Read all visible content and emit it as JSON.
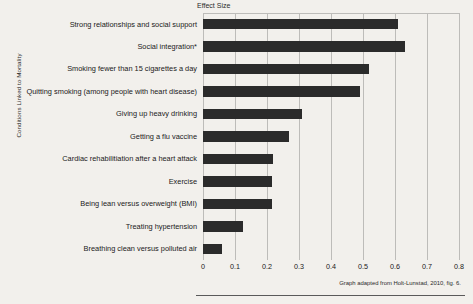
{
  "chart_data": {
    "type": "bar",
    "orientation": "horizontal",
    "title": "Effect Size",
    "xlabel": "Effect Size",
    "ylabel": "Conditions Linked to Mortality",
    "xlim": [
      0,
      0.8
    ],
    "xticks": [
      "0",
      "0.1",
      "0.2",
      "0.3",
      "0.4",
      "0.5",
      "0.6",
      "0.7",
      "0.8"
    ],
    "xtick_values": [
      0,
      0.1,
      0.2,
      0.3,
      0.4,
      0.5,
      0.6,
      0.7,
      0.8
    ],
    "grid": true,
    "legend": "none",
    "bar_color": "#2b2b2b",
    "background_color": "#f2f0ec",
    "gridline_color": "#bdbcb9",
    "categories": [
      "Strong relationships and social support",
      "Social integration*",
      "Smoking fewer than 15 cigarettes a day",
      "Quitting smoking (among people with heart disease)",
      "Giving up heavy drinking",
      "Getting a flu vaccine",
      "Cardiac rehabilitiation after a heart attack",
      "Exercise",
      "Being lean versus  overweight (BMI)",
      "Treating hypertension",
      "Breathing clean versus polluted air"
    ],
    "values": [
      0.61,
      0.63,
      0.52,
      0.49,
      0.31,
      0.27,
      0.22,
      0.215,
      0.215,
      0.125,
      0.06
    ],
    "annotation": "Graph adapted from Holt-Lunstad, 2010, fig. 6."
  }
}
